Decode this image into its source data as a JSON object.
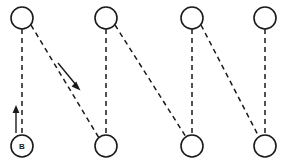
{
  "diagram": {
    "canvas": {
      "width": 289,
      "height": 163,
      "background": "#ffffff"
    },
    "style": {
      "node_stroke": "#1a1a1a",
      "node_fill": "#ffffff",
      "node_radius": 11,
      "edge_stroke": "#1a1a1a",
      "edge_dasharray": "5 4",
      "arrow_stroke": "#1a1a1a"
    },
    "nodes": [
      {
        "id": "t1",
        "label": "",
        "row": "top",
        "cx": 22,
        "cy": 18,
        "r": 11
      },
      {
        "id": "t2",
        "label": "",
        "row": "top",
        "cx": 106,
        "cy": 18,
        "r": 11
      },
      {
        "id": "t3",
        "label": "",
        "row": "top",
        "cx": 192,
        "cy": 18,
        "r": 11
      },
      {
        "id": "t4",
        "label": "",
        "row": "top",
        "cx": 265,
        "cy": 18,
        "r": 11
      },
      {
        "id": "b1",
        "label": "B",
        "row": "bottom",
        "cx": 22,
        "cy": 146,
        "r": 11
      },
      {
        "id": "b2",
        "label": "",
        "row": "bottom",
        "cx": 106,
        "cy": 146,
        "r": 11
      },
      {
        "id": "b3",
        "label": "",
        "row": "bottom",
        "cx": 192,
        "cy": 146,
        "r": 11
      },
      {
        "id": "b4",
        "label": "",
        "row": "bottom",
        "cx": 265,
        "cy": 146,
        "r": 11
      }
    ],
    "edges": [
      {
        "id": "e-t1-b1",
        "from": "t1",
        "to": "b1",
        "kind": "dashed",
        "x1": 22,
        "y1": 29,
        "x2": 22,
        "y2": 135
      },
      {
        "id": "e-t1-b2",
        "from": "t1",
        "to": "b2",
        "kind": "dashed",
        "x1": 31,
        "y1": 25,
        "x2": 99,
        "y2": 138
      },
      {
        "id": "e-t2-b2",
        "from": "t2",
        "to": "b2",
        "kind": "dashed",
        "x1": 106,
        "y1": 29,
        "x2": 106,
        "y2": 135
      },
      {
        "id": "e-t2-b3",
        "from": "t2",
        "to": "b3",
        "kind": "dashed",
        "x1": 115,
        "y1": 25,
        "x2": 186,
        "y2": 137
      },
      {
        "id": "e-t3-b3",
        "from": "t3",
        "to": "b3",
        "kind": "dashed",
        "x1": 192,
        "y1": 29,
        "x2": 192,
        "y2": 135
      },
      {
        "id": "e-t3-b4",
        "from": "t3",
        "to": "b4",
        "kind": "dashed",
        "x1": 201,
        "y1": 25,
        "x2": 259,
        "y2": 137
      },
      {
        "id": "e-t4-b4",
        "from": "t4",
        "to": "b4",
        "kind": "dashed",
        "x1": 265,
        "y1": 29,
        "x2": 265,
        "y2": 135
      }
    ],
    "arrows": [
      {
        "id": "arrow-up-b1",
        "description": "upward solid arrow alongside edge from B to top-left node",
        "direction": "up",
        "x1": 16,
        "y1": 133,
        "x2": 16,
        "y2": 107
      },
      {
        "id": "arrow-diagonal-t1-b2",
        "description": "solid arrow pointing down-right along diagonal edge",
        "direction": "down-right",
        "x1": 58,
        "y1": 63,
        "x2": 79,
        "y2": 89
      }
    ]
  }
}
